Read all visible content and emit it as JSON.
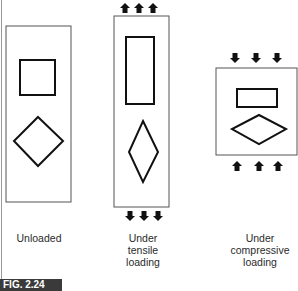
{
  "figure": {
    "label": "FIG. 2.24",
    "panels": [
      {
        "id": "unloaded",
        "caption": [
          "Unloaded"
        ]
      },
      {
        "id": "tensile",
        "caption": [
          "Under",
          "tensile",
          "loading"
        ]
      },
      {
        "id": "compressive",
        "caption": [
          "Under",
          "compressive",
          "loading"
        ]
      }
    ]
  },
  "colors": {
    "stroke": "#111111",
    "frame": "#555555",
    "label_bg": "#3a3a3a"
  }
}
